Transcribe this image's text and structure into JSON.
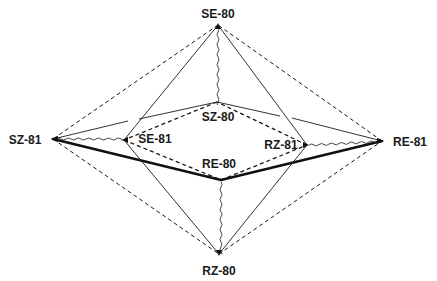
{
  "diagram": {
    "type": "octahedral-comparison",
    "outer_nodes": {
      "top": {
        "label": "SE-80",
        "x": 218,
        "y": 25
      },
      "left": {
        "label": "SZ-81",
        "x": 53,
        "y": 139
      },
      "right": {
        "label": "RE-81",
        "x": 382,
        "y": 141
      },
      "bottom": {
        "label": "RZ-80",
        "x": 219,
        "y": 254
      }
    },
    "inner_nodes": {
      "top": {
        "label": "SZ-80",
        "x": 217,
        "y": 102
      },
      "left": {
        "label": "SE-81",
        "x": 124,
        "y": 140
      },
      "right": {
        "label": "RZ-81",
        "x": 307,
        "y": 145
      },
      "bottom": {
        "label": "RE-80",
        "x": 221,
        "y": 180
      }
    },
    "line_styles": {
      "solid_thin": "thin solid",
      "solid_thick": "thick solid",
      "dashed": "dashed",
      "wavy": "wavy"
    },
    "colors": {
      "line": "#1a1a1a",
      "background": "#ffffff"
    }
  }
}
